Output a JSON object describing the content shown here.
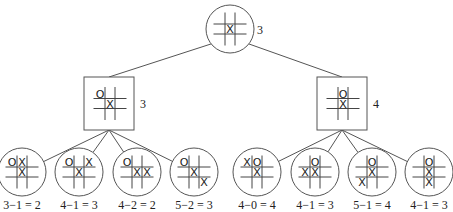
{
  "diagram": {
    "root": {
      "shape": "circle",
      "cx": 230,
      "cy": 29,
      "r": 24,
      "board": [
        "",
        "",
        "",
        "",
        "X",
        "",
        "",
        "",
        ""
      ],
      "value": "3"
    },
    "level1": [
      {
        "shape": "square",
        "x": 84,
        "y": 77,
        "w": 50,
        "h": 53,
        "board": [
          "O",
          "",
          "",
          "",
          "X",
          "",
          "",
          "",
          ""
        ],
        "value": "3"
      },
      {
        "shape": "square",
        "x": 317,
        "y": 77,
        "w": 50,
        "h": 53,
        "board": [
          "",
          "O",
          "",
          "",
          "X",
          "",
          "",
          "",
          ""
        ],
        "value": "4"
      }
    ],
    "leaves": [
      {
        "cx": 22,
        "cy": 172,
        "board": [
          "O",
          "X",
          "",
          "",
          "X",
          "",
          "",
          "",
          ""
        ],
        "equation": "3−1 = 2",
        "parent": 0
      },
      {
        "cx": 79,
        "cy": 172,
        "board": [
          "O",
          "",
          "X",
          "",
          "X",
          "",
          "",
          "",
          ""
        ],
        "equation": "4−1 = 3",
        "parent": 0
      },
      {
        "cx": 137,
        "cy": 172,
        "board": [
          "O",
          "",
          "",
          "",
          "X",
          "X",
          "",
          "",
          ""
        ],
        "equation": "4−2 = 2",
        "parent": 0
      },
      {
        "cx": 194,
        "cy": 172,
        "board": [
          "O",
          "",
          "",
          "",
          "X",
          "",
          "",
          "",
          "X"
        ],
        "equation": "5−2 = 3",
        "parent": 0
      },
      {
        "cx": 257,
        "cy": 172,
        "board": [
          "X",
          "O",
          "",
          "",
          "X",
          "",
          "",
          "",
          ""
        ],
        "equation": "4−0 = 4",
        "parent": 1
      },
      {
        "cx": 315,
        "cy": 172,
        "board": [
          "",
          "O",
          "",
          "X",
          "X",
          "",
          "",
          "",
          ""
        ],
        "equation": "4−1 = 3",
        "parent": 1
      },
      {
        "cx": 372,
        "cy": 172,
        "board": [
          "",
          "O",
          "",
          "",
          "X",
          "",
          "X",
          "",
          ""
        ],
        "equation": "5−1 = 4",
        "parent": 1
      },
      {
        "cx": 429,
        "cy": 172,
        "board": [
          "",
          "O",
          "",
          "",
          "X",
          "",
          "",
          "X",
          ""
        ],
        "equation": "4−1 = 3",
        "parent": 1
      }
    ],
    "leaf_radius": 24
  }
}
